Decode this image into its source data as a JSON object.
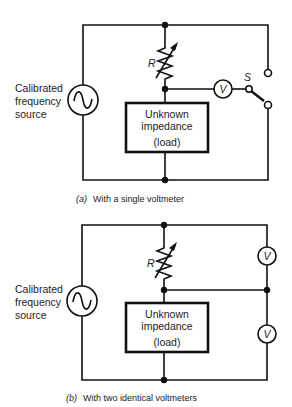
{
  "diagram_a": {
    "source_label": [
      "Calibrated",
      "frequency",
      "source"
    ],
    "resistor_label": "R",
    "load_label": [
      "Unknown",
      "impedance",
      "(load)"
    ],
    "voltmeter_label": "V",
    "switch_label": "S",
    "caption_prefix": "(a)",
    "caption_text": "With a single voltmeter"
  },
  "diagram_b": {
    "source_label": [
      "Calibrated",
      "frequency",
      "source"
    ],
    "resistor_label": "R",
    "load_label": [
      "Unknown",
      "impedance",
      "(load)"
    ],
    "voltmeter_upper_label": "V",
    "voltmeter_lower_label": "V",
    "caption_prefix": "(b)",
    "caption_text": "With two identical voltmeters"
  },
  "icons": {
    "ac_source": "sine-wave-in-circle",
    "variable_resistor": "zigzag-with-arrow",
    "voltmeter": "V-in-circle",
    "switch": "spdt-switch"
  }
}
